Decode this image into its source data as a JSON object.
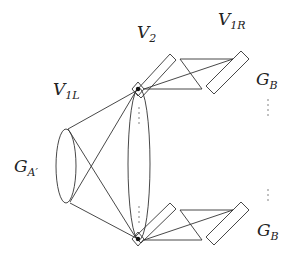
{
  "diagram": {
    "labels": {
      "v2": {
        "main": "V",
        "sub": "2"
      },
      "v1l": {
        "main": "V",
        "sub": "1L"
      },
      "v1r": {
        "main": "V",
        "sub": "1R"
      },
      "ga": {
        "main": "G",
        "sub": "A′"
      },
      "gb_top": {
        "main": "G",
        "sub": "B"
      },
      "gb_bottom": {
        "main": "G",
        "sub": "B"
      }
    },
    "ellipsis_glyph": "⋮",
    "colors": {
      "stroke": "#333333",
      "background": "#ffffff"
    }
  }
}
